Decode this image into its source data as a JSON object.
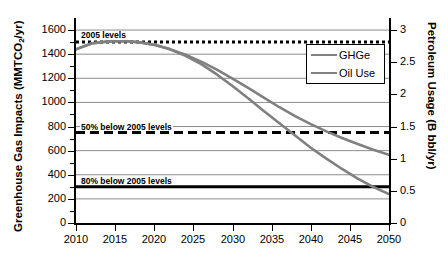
{
  "chart_data": {
    "type": "line",
    "title": "",
    "xlabel": "",
    "ylabel": "Greenhouse Gas Impacts (MMTCO2/yr)",
    "ylabel_main": "Greenhouse Gas Impacts (MMTCO",
    "ylabel_sub": "2",
    "ylabel_tail": "/yr)",
    "y2label": "Petroleum Usage (B bbl/yr)",
    "xlim": [
      2010,
      2050
    ],
    "ylim": [
      0,
      1700
    ],
    "y2lim": [
      0,
      3.1875
    ],
    "grid": true,
    "legend_position": "upper right",
    "xticks": [
      2010,
      2015,
      2020,
      2025,
      2030,
      2035,
      2040,
      2045,
      2050
    ],
    "xticklabels": [
      "2010",
      "2015",
      "2020",
      "2025",
      "2030",
      "2035",
      "2040",
      "2045",
      "2050"
    ],
    "yticks": [
      0,
      200,
      400,
      600,
      800,
      1000,
      1200,
      1400,
      1600
    ],
    "yticklabels": [
      "0",
      "200",
      "400",
      "600",
      "800",
      "1000",
      "1200",
      "1400",
      "1600"
    ],
    "yminorticks": [
      100,
      300,
      500,
      700,
      900,
      1100,
      1300,
      1500
    ],
    "y2ticks": [
      0,
      0.5,
      1,
      1.5,
      2,
      2.5,
      3
    ],
    "y2ticklabels": [
      "0",
      "0.5",
      "1",
      "1.5",
      "2",
      "2.5",
      "3"
    ],
    "series": [
      {
        "name": "GHGe",
        "color": "#808080",
        "axis": "left",
        "x": [
          2010,
          2012,
          2014,
          2016,
          2018,
          2020,
          2022,
          2024,
          2026,
          2028,
          2030,
          2032,
          2034,
          2036,
          2038,
          2040,
          2042,
          2044,
          2046,
          2048,
          2050
        ],
        "values": [
          1440,
          1490,
          1505,
          1510,
          1500,
          1478,
          1442,
          1395,
          1338,
          1272,
          1198,
          1120,
          1040,
          960,
          886,
          820,
          760,
          705,
          655,
          608,
          565
        ]
      },
      {
        "name": "Oil Use",
        "color": "#808080",
        "axis": "right",
        "x": [
          2010,
          2012,
          2014,
          2016,
          2018,
          2020,
          2022,
          2024,
          2026,
          2028,
          2030,
          2032,
          2034,
          2036,
          2038,
          2040,
          2042,
          2044,
          2046,
          2048,
          2050
        ],
        "values": [
          2.7,
          2.79,
          2.82,
          2.83,
          2.81,
          2.77,
          2.7,
          2.6,
          2.47,
          2.31,
          2.13,
          1.94,
          1.74,
          1.55,
          1.36,
          1.17,
          1.0,
          0.84,
          0.69,
          0.56,
          0.45
        ]
      }
    ],
    "reference_lines": [
      {
        "name": "2005 levels",
        "label": "2005 levels",
        "value": 1500,
        "style": "dotted",
        "color": "#000000",
        "width": 3
      },
      {
        "name": "50% below 2005 levels",
        "label": "50% below 2005 levels",
        "value": 750,
        "style": "dashed",
        "color": "#000000",
        "width": 3
      },
      {
        "name": "80% below 2005 levels",
        "label": "80% below 2005 levels",
        "value": 300,
        "style": "solid",
        "color": "#000000",
        "width": 3
      }
    ],
    "legend": [
      {
        "label": "GHGe",
        "color": "#808080"
      },
      {
        "label": "Oil Use",
        "color": "#808080"
      }
    ]
  }
}
